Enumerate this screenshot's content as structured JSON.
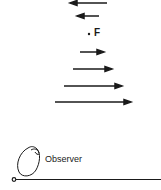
{
  "diagram": {
    "focus_label": "F",
    "observer_label": "Observer",
    "arrows": [
      {
        "y": 3,
        "x1": 71,
        "x2": 107,
        "direction": "left"
      },
      {
        "y": 16,
        "x1": 78,
        "x2": 99,
        "direction": "left"
      },
      {
        "y": 52,
        "x1": 80,
        "x2": 103,
        "direction": "right"
      },
      {
        "y": 69,
        "x1": 73,
        "x2": 111,
        "direction": "right"
      },
      {
        "y": 86,
        "x1": 64,
        "x2": 121,
        "direction": "right"
      },
      {
        "y": 102,
        "x1": 55,
        "x2": 130,
        "direction": "right"
      }
    ],
    "colors": {
      "ink": "#1a1a1a",
      "background": "#ffffff"
    }
  }
}
